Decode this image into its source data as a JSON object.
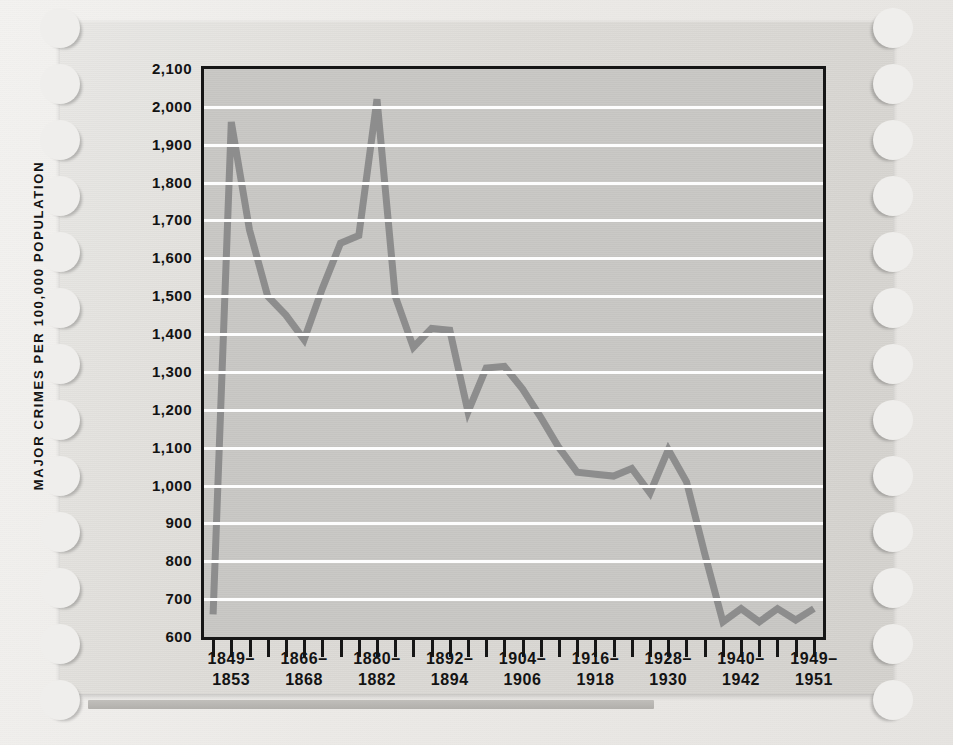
{
  "figure": {
    "background_color": "#efeeec",
    "card_color": "#ded ",
    "plot_bg_color": "#c9c8c5",
    "line_color": "#8d8d8d",
    "gridline_color": "#fdfdfd",
    "axis_color": "#161616"
  },
  "axis": {
    "y_title": "MAJOR CRIMES PER 100,000 POPULATION",
    "y_ticklabels": [
      "2,100",
      "2,000",
      "1,900",
      "1,800",
      "1,700",
      "1,600",
      "1,500",
      "1,400",
      "1,300",
      "1,200",
      "1,100",
      "1,000",
      "900",
      "800",
      "700",
      "600"
    ],
    "x_ticklabels": [
      {
        "top": "1849–",
        "bottom": "1853"
      },
      {
        "top": "1866–",
        "bottom": "1868"
      },
      {
        "top": "1880–",
        "bottom": "1882"
      },
      {
        "top": "1892–",
        "bottom": "1894"
      },
      {
        "top": "1904–",
        "bottom": "1906"
      },
      {
        "top": "1916–",
        "bottom": "1918"
      },
      {
        "top": "1928–",
        "bottom": "1930"
      },
      {
        "top": "1940–",
        "bottom": "1942"
      },
      {
        "top": "1949–",
        "bottom": "1951"
      }
    ],
    "x_tick_count": 34
  },
  "chart_data": {
    "type": "line",
    "title": "",
    "subtitle": "",
    "xlabel": "",
    "ylabel": "MAJOR CRIMES PER 100,000 POPULATION",
    "ylim": [
      600,
      2100
    ],
    "ytick_step": 100,
    "grid": "horizontal",
    "legend": "none",
    "x_period_labels": [
      "1849-1853",
      "1866-1868",
      "1880-1882",
      "1892-1894",
      "1904-1906",
      "1916-1918",
      "1928-1930",
      "1940-1942",
      "1949-1951"
    ],
    "series": [
      {
        "name": "Major crimes per 100,000 population",
        "color": "#8d8d8d",
        "x_index": [
          0,
          1,
          2,
          3,
          4,
          5,
          6,
          7,
          8,
          9,
          10,
          11,
          12,
          13,
          14,
          15,
          16,
          17,
          18,
          19,
          20,
          21,
          22,
          23,
          24,
          25,
          26,
          27,
          28,
          29,
          30,
          31,
          32,
          33
        ],
        "values": [
          660,
          1960,
          1675,
          1500,
          1450,
          1385,
          1520,
          1640,
          1660,
          2020,
          1500,
          1365,
          1415,
          1410,
          1195,
          1310,
          1315,
          1255,
          1180,
          1100,
          1035,
          1030,
          1025,
          1045,
          980,
          1095,
          1010,
          820,
          640,
          675,
          640,
          675,
          645,
          675
        ]
      }
    ]
  }
}
